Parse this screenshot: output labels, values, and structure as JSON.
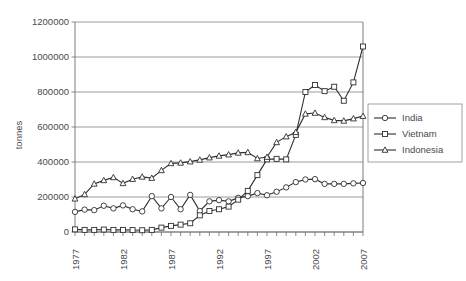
{
  "chart_data": {
    "type": "line",
    "title": "",
    "xlabel": "",
    "ylabel": "tonnes",
    "ylim": [
      0,
      1200000
    ],
    "ytick_values": [
      0,
      200000,
      400000,
      600000,
      800000,
      1000000,
      1200000
    ],
    "ytick_labels": [
      "0",
      "200000",
      "400000",
      "600000",
      "800000",
      "1000000",
      "1200000"
    ],
    "xlim": [
      1977,
      2007
    ],
    "x": [
      1977,
      1978,
      1979,
      1980,
      1981,
      1982,
      1983,
      1984,
      1985,
      1986,
      1987,
      1988,
      1989,
      1990,
      1991,
      1992,
      1993,
      1994,
      1995,
      1996,
      1997,
      1998,
      1999,
      2000,
      2001,
      2002,
      2003,
      2004,
      2005,
      2006,
      2007
    ],
    "xtick_labels": [
      "1977",
      "1982",
      "1987",
      "1992",
      "1997",
      "2002",
      "2007"
    ],
    "xtick_values": [
      1977,
      1982,
      1987,
      1992,
      1997,
      2002,
      2007
    ],
    "grid": "horizontal",
    "legend_position": "right",
    "series": [
      {
        "name": "India",
        "marker": "circle",
        "values": [
          115000,
          128000,
          125000,
          150000,
          135000,
          152000,
          130000,
          118000,
          205000,
          135000,
          200000,
          130000,
          212000,
          120000,
          175000,
          182000,
          175000,
          195000,
          205000,
          222000,
          210000,
          230000,
          255000,
          285000,
          300000,
          302000,
          275000,
          275000,
          275000,
          278000,
          280000
        ]
      },
      {
        "name": "Vietnam",
        "marker": "square",
        "values": [
          15000,
          12000,
          12000,
          14000,
          12000,
          12000,
          11000,
          10000,
          12000,
          25000,
          35000,
          42000,
          50000,
          95000,
          120000,
          130000,
          145000,
          185000,
          235000,
          325000,
          415000,
          418000,
          415000,
          555000,
          800000,
          840000,
          805000,
          830000,
          750000,
          855000,
          1060000
        ]
      },
      {
        "name": "Indonesia",
        "marker": "triangle",
        "values": [
          190000,
          215000,
          275000,
          295000,
          312000,
          278000,
          302000,
          315000,
          308000,
          352000,
          392000,
          395000,
          402000,
          412000,
          425000,
          435000,
          442000,
          452000,
          455000,
          420000,
          428000,
          512000,
          545000,
          570000,
          675000,
          680000,
          655000,
          638000,
          635000,
          648000,
          662000
        ]
      }
    ]
  },
  "legend": {
    "items": [
      {
        "label": "India",
        "marker": "circle"
      },
      {
        "label": "Vietnam",
        "marker": "square"
      },
      {
        "label": "Indonesia",
        "marker": "triangle"
      }
    ]
  }
}
